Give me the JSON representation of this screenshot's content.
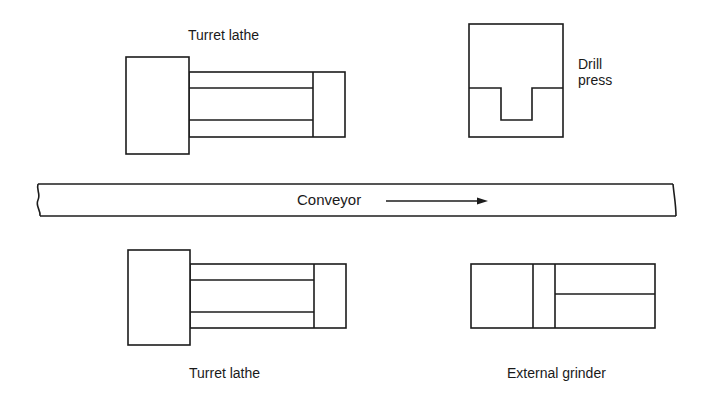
{
  "diagram": {
    "type": "plant-layout",
    "stations": [
      {
        "id": "turret-lathe-top",
        "label": "Turret lathe",
        "position": "top-left"
      },
      {
        "id": "drill-press",
        "label_line1": "Drill",
        "label_line2": "press",
        "position": "top-right"
      },
      {
        "id": "turret-lathe-bottom",
        "label": "Turret lathe",
        "position": "bottom-left"
      },
      {
        "id": "external-grinder",
        "label": "External grinder",
        "position": "bottom-right"
      }
    ],
    "conveyor": {
      "label": "Conveyor",
      "direction": "left-to-right"
    },
    "colors": {
      "stroke": "#1c1c1c",
      "background": "#ffffff"
    }
  }
}
